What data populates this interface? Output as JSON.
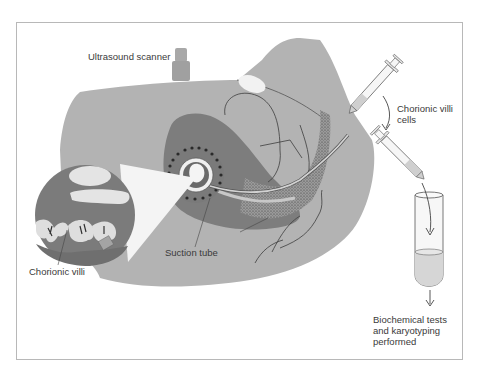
{
  "diagram": {
    "labels": {
      "ultrasound_scanner": "Ultrasound scanner",
      "chorionic_villi_cells": "Chorionic villi cells",
      "suction_tube": "Suction tube",
      "chorionic_villi": "Chorionic villi",
      "biochemical_tests": "Biochemical tests and karyotyping performed"
    },
    "components": [
      {
        "id": "body",
        "name": "Maternal abdomen (cross-section)"
      },
      {
        "id": "scanner",
        "name": "Ultrasound scanner probe"
      },
      {
        "id": "uterus",
        "name": "Uterus"
      },
      {
        "id": "fetal-sac",
        "name": "Gestational sac with embryo"
      },
      {
        "id": "magnifier",
        "name": "Magnified view of chorionic villi"
      },
      {
        "id": "suction-tube",
        "name": "Suction tube (catheter)"
      },
      {
        "id": "syringe-1",
        "name": "Syringe attached to suction tube"
      },
      {
        "id": "syringe-2",
        "name": "Syringe emptying cells"
      },
      {
        "id": "test-tube",
        "name": "Test tube with sample"
      }
    ],
    "flow": [
      {
        "from": "syringe-1",
        "to": "syringe-2",
        "label": "Chorionic villi cells"
      },
      {
        "from": "syringe-2",
        "to": "test-tube",
        "label": ""
      },
      {
        "from": "test-tube",
        "to": "result",
        "label": "Biochemical tests and karyotyping performed"
      }
    ],
    "colors": {
      "body": "#b3b3b3",
      "body_dark": "#8a8a8a",
      "uterus_wall": "#7d7d7d",
      "light_area": "#e2e2e2",
      "outline": "#4a4a4a",
      "frame": "#b8b8b8"
    }
  }
}
